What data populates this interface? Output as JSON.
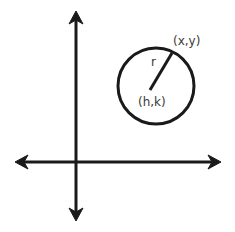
{
  "diagram": {
    "labels": {
      "point": "(x,y)",
      "radius": "r",
      "center": "(h,k)"
    },
    "colors": {
      "stroke": "#1a1a1a",
      "text": "#3a3a3a",
      "background": "#ffffff"
    },
    "axes": {
      "x_axis": {
        "y": 162,
        "x_from": 16,
        "x_to": 220
      },
      "y_axis": {
        "x": 76,
        "y_from": 12,
        "y_to": 220
      }
    },
    "circle": {
      "cx": 156,
      "cy": 86,
      "r": 38
    }
  }
}
